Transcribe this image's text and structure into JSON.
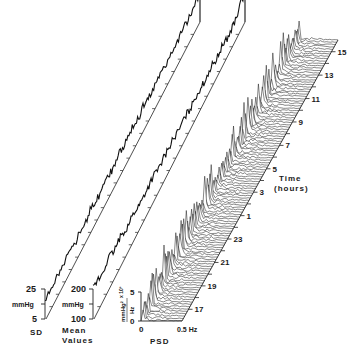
{
  "chart_data": {
    "type": "area",
    "title": "",
    "panels": [
      {
        "id": "sd",
        "label": "SD",
        "unit": "mmHg",
        "ylim": [
          5,
          25
        ],
        "yticks": [
          "25",
          "mmHg",
          "5"
        ],
        "series_trend": "fluctuating, stepwise rising toward later hours",
        "values_approx": [
          10,
          12,
          11,
          13,
          12,
          14,
          13,
          15,
          14,
          16,
          15,
          17,
          16,
          18,
          17,
          19,
          18,
          20,
          19,
          21,
          20,
          22,
          21,
          24
        ]
      },
      {
        "id": "mean",
        "label": "Mean Values",
        "label_line1": "Mean",
        "label_line2": "Values",
        "unit": "mmHg",
        "ylim": [
          100,
          200
        ],
        "yticks": [
          "200",
          "mmHg",
          "100"
        ],
        "series_trend": "fluctuating around ~150, peak near end",
        "values_approx": [
          150,
          145,
          155,
          148,
          152,
          146,
          150,
          144,
          148,
          152,
          147,
          150,
          155,
          149,
          153,
          150,
          156,
          152,
          158,
          154,
          160,
          157,
          165,
          190
        ]
      },
      {
        "id": "psd",
        "label": "PSD",
        "xlabel_left": "0",
        "xlabel_right": "0.5 Hz",
        "y_unit_num": "mmHg²",
        "y_unit_den": "Hz",
        "y_multiplier": "x 10³",
        "yticks": [
          "5",
          "0"
        ],
        "ylim": [
          0,
          5
        ]
      }
    ],
    "time_axis": {
      "label_line1": "Time",
      "label_line2": "(hours)",
      "ticks": [
        "17",
        "19",
        "21",
        "23",
        "1",
        "3",
        "5",
        "7",
        "9",
        "11",
        "13",
        "15"
      ]
    }
  },
  "labels": {
    "sd": "SD",
    "sd_top": "25",
    "sd_unit": "mmHg",
    "sd_bottom": "5",
    "mean1": "Mean",
    "mean2": "Values",
    "mean_top": "200",
    "mean_unit": "mmHg",
    "mean_bottom": "100",
    "psd": "PSD",
    "psd_x0": "0",
    "psd_x1": "0.5 Hz",
    "psd_y5": "5",
    "psd_y0": "0",
    "psd_unit_num": "mmHg²",
    "psd_unit_den": "Hz",
    "psd_mult": "x 10³",
    "time1": "Time",
    "time2": "(hours)"
  }
}
